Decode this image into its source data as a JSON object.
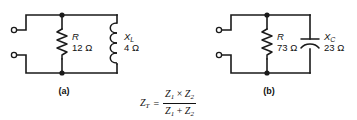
{
  "figure": {
    "background_color": "#ffffff",
    "line_color": "#1a1a1a",
    "circuits": [
      {
        "caption": "(a)",
        "type": "parallel-RL",
        "components": [
          {
            "kind": "resistor",
            "symbol": "R",
            "subscript": "",
            "value": "12 Ω"
          },
          {
            "kind": "inductor",
            "symbol": "X",
            "subscript": "L",
            "value": "4 Ω"
          }
        ],
        "terminals": 2
      },
      {
        "caption": "(b)",
        "type": "parallel-RC",
        "components": [
          {
            "kind": "resistor",
            "symbol": "R",
            "subscript": "",
            "value": "73 Ω"
          },
          {
            "kind": "capacitor",
            "symbol": "X",
            "subscript": "C",
            "value": "23 Ω"
          }
        ],
        "terminals": 2
      }
    ],
    "formula": {
      "lhs_symbol": "Z",
      "lhs_subscript": "T",
      "equals": "=",
      "numerator": {
        "left_symbol": "Z",
        "left_subscript": "1",
        "operator": "×",
        "right_symbol": "Z",
        "right_subscript": "2"
      },
      "denominator": {
        "left_symbol": "Z",
        "left_subscript": "1",
        "operator": "+",
        "right_symbol": "Z",
        "right_subscript": "2"
      }
    }
  }
}
